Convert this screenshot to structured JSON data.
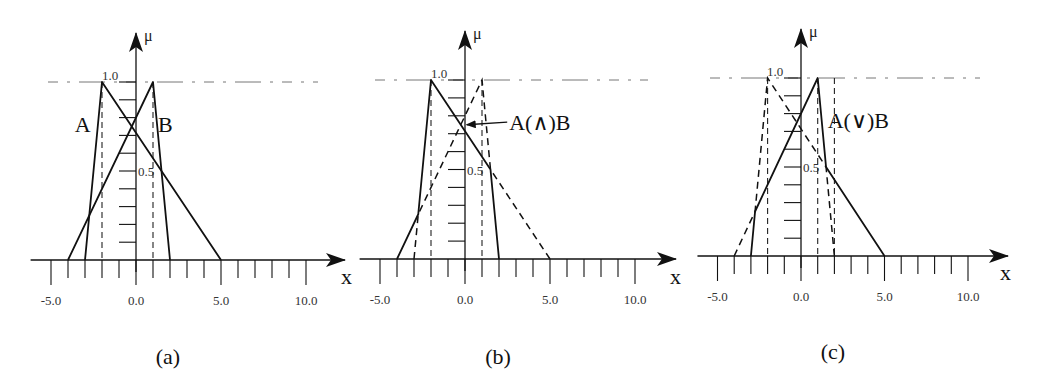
{
  "figure": {
    "captions": [
      "(a)",
      "(b)",
      "(c)"
    ]
  },
  "chart_data": [
    {
      "type": "line",
      "panel": "(a)",
      "title": "",
      "xlabel": "x",
      "ylabel": "μ",
      "xlim": [
        -5.5,
        12
      ],
      "ylim": [
        0,
        1.2
      ],
      "x_tick_labels": [
        "-5.0",
        "0.0",
        "5.0",
        "10.0"
      ],
      "x_tick_values": [
        -5,
        -4,
        -3,
        -2,
        -1,
        0,
        1,
        2,
        3,
        4,
        5,
        6,
        7,
        8,
        9,
        10
      ],
      "y_tick_labels": [
        "1.0",
        "0.5"
      ],
      "y_tick_values": [
        0.1,
        0.2,
        0.3,
        0.4,
        0.5,
        0.6,
        0.7,
        0.8,
        0.9,
        1.0
      ],
      "grid": false,
      "reference_line": {
        "y": 1.0,
        "style": "dash-dot"
      },
      "series": [
        {
          "name": "A",
          "style": "solid",
          "x": [
            -3,
            -2,
            5
          ],
          "y": [
            0,
            1,
            0
          ]
        },
        {
          "name": "B",
          "style": "solid",
          "x": [
            -4,
            1,
            2
          ],
          "y": [
            0,
            1,
            0
          ]
        }
      ],
      "vertical_guides": [
        -2,
        1
      ],
      "annotations": [
        {
          "text": "A",
          "x": -3.6,
          "y": 0.72
        },
        {
          "text": "B",
          "x": 1.3,
          "y": 0.72
        }
      ]
    },
    {
      "type": "line",
      "panel": "(b)",
      "title": "",
      "xlabel": "x",
      "ylabel": "μ",
      "xlim": [
        -5.5,
        12
      ],
      "ylim": [
        0,
        1.2
      ],
      "x_tick_labels": [
        "-5.0",
        "0.0",
        "5.0",
        "10.0"
      ],
      "x_tick_values": [
        -5,
        -4,
        -3,
        -2,
        -1,
        0,
        1,
        2,
        3,
        4,
        5,
        6,
        7,
        8,
        9,
        10
      ],
      "y_tick_labels": [
        "1.0",
        "0.5"
      ],
      "y_tick_values": [
        0.1,
        0.2,
        0.3,
        0.4,
        0.5,
        0.6,
        0.7,
        0.8,
        0.9,
        1.0
      ],
      "grid": false,
      "reference_line": {
        "y": 1.0,
        "style": "dash-dot"
      },
      "series": [
        {
          "name": "A(∧)B",
          "style": "solid",
          "x": [
            -4,
            -2.75,
            -2,
            1.5,
            2
          ],
          "y": [
            0,
            0.25,
            1,
            0.5,
            0
          ]
        },
        {
          "name": "remaining",
          "style": "dashed",
          "x": [
            -3,
            -2.75,
            1,
            1.5,
            5
          ],
          "y": [
            0,
            0.25,
            1,
            0.5,
            0
          ]
        }
      ],
      "vertical_guides": [
        -2,
        1
      ],
      "annotations": [
        {
          "text": "A(∧)B",
          "x": 2.6,
          "y": 0.72,
          "arrow_to": [
            0.1,
            0.75
          ]
        }
      ]
    },
    {
      "type": "line",
      "panel": "(c)",
      "title": "",
      "xlabel": "x",
      "ylabel": "μ",
      "xlim": [
        -5.5,
        12
      ],
      "ylim": [
        0,
        1.2
      ],
      "x_tick_labels": [
        "-5.0",
        "0.0",
        "5.0",
        "10.0"
      ],
      "x_tick_values": [
        -5,
        -4,
        -3,
        -2,
        -1,
        0,
        1,
        2,
        3,
        4,
        5,
        6,
        7,
        8,
        9,
        10
      ],
      "y_tick_labels": [
        "1.0",
        "0.5"
      ],
      "y_tick_values": [
        0.1,
        0.2,
        0.3,
        0.4,
        0.5,
        0.6,
        0.7,
        0.8,
        0.9,
        1.0
      ],
      "grid": false,
      "reference_line": {
        "y": 1.0,
        "style": "dash-dot"
      },
      "series": [
        {
          "name": "A(∨)B",
          "style": "solid",
          "x": [
            -3,
            -2.75,
            1,
            1.5,
            5
          ],
          "y": [
            0,
            0.25,
            1,
            0.5,
            0
          ]
        },
        {
          "name": "remaining",
          "style": "dashed",
          "x": [
            -4,
            -2.75,
            -2,
            1.5,
            2
          ],
          "y": [
            0,
            0.25,
            1,
            0.5,
            0
          ]
        }
      ],
      "vertical_guides": [
        -2,
        1,
        2
      ],
      "annotations": [
        {
          "text": "A(∨)B",
          "x": 1.6,
          "y": 0.72
        }
      ]
    }
  ],
  "panels": [
    {
      "x0": 136,
      "axis_y": 260,
      "top_y": 82,
      "unit": 17.0,
      "arrow_x": 345,
      "ref_left": 48,
      "ref_right": 318,
      "mu_arrow_top": 33,
      "caption_x": 168,
      "caption_y": 364,
      "x_label_x": 341,
      "x_label_y": 284
    },
    {
      "x0": 465,
      "axis_y": 259,
      "top_y": 80,
      "unit": 17.0,
      "arrow_x": 676,
      "ref_left": 375,
      "ref_right": 648,
      "mu_arrow_top": 31,
      "caption_x": 498,
      "caption_y": 364,
      "x_label_x": 670,
      "x_label_y": 284
    },
    {
      "x0": 801,
      "axis_y": 256,
      "top_y": 78,
      "unit": 16.7,
      "arrow_x": 1008,
      "ref_left": 710,
      "ref_right": 980,
      "mu_arrow_top": 29,
      "caption_x": 833,
      "caption_y": 359,
      "x_label_x": 1000,
      "x_label_y": 280
    }
  ]
}
